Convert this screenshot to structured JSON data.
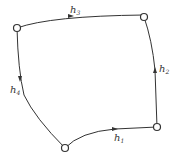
{
  "diagram": {
    "type": "directed-cycle-graph",
    "nodes": [
      {
        "id": "top-left",
        "x": 17,
        "y": 28
      },
      {
        "id": "top-right",
        "x": 144,
        "y": 17
      },
      {
        "id": "bottom-right",
        "x": 157,
        "y": 127
      },
      {
        "id": "bottom",
        "x": 65,
        "y": 148
      }
    ],
    "edges": [
      {
        "label": "h",
        "sub": "1",
        "from": "bottom",
        "to": "bottom-right"
      },
      {
        "label": "h",
        "sub": "2",
        "from": "bottom-right",
        "to": "top-right"
      },
      {
        "label": "h",
        "sub": "3",
        "from": "top-left",
        "to": "top-right"
      },
      {
        "label": "h",
        "sub": "4",
        "from": "top-left",
        "to": "bottom"
      }
    ]
  }
}
